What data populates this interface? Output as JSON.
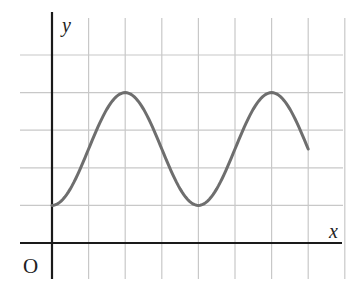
{
  "chart_data": {
    "type": "line",
    "title": "",
    "xlabel": "x",
    "ylabel": "y",
    "origin_label": "O",
    "grid": true,
    "tick_labels": false,
    "grid_units": {
      "x_range": [
        0,
        8
      ],
      "y_range": [
        -1,
        5
      ]
    },
    "function_description": "Sinusoidal curve y = 2.5 - 1.5*cos(pi*x/2) in grid units, drawn from x=0 to x=7",
    "series": [
      {
        "name": "curve",
        "x": [
          0,
          0.5,
          1,
          1.5,
          2,
          2.5,
          3,
          3.5,
          4,
          4.5,
          5,
          5.5,
          6,
          6.5,
          7
        ],
        "values": [
          1.0,
          1.44,
          2.5,
          3.56,
          4.0,
          3.56,
          2.5,
          1.44,
          1.0,
          1.44,
          2.5,
          3.56,
          4.0,
          3.56,
          2.5
        ]
      }
    ],
    "key_points": {
      "minima": [
        [
          0,
          1
        ],
        [
          4,
          1
        ]
      ],
      "maxima": [
        [
          2,
          4
        ],
        [
          6,
          4
        ]
      ],
      "end": [
        7,
        2.5
      ]
    },
    "colors": {
      "curve": "#6e6e6e",
      "axes": "#1a1a1a",
      "grid": "#c8c8c8"
    }
  }
}
